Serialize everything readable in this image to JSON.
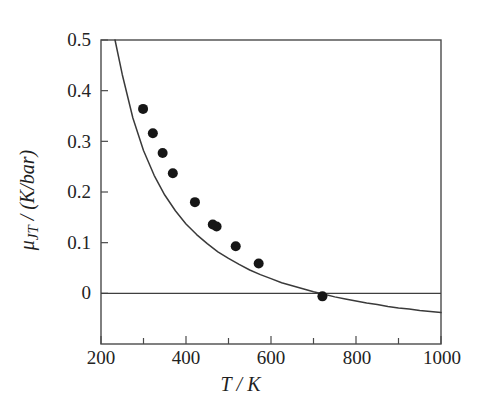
{
  "figure": {
    "background": "#ffffff",
    "frame_color": "#4a4a4a",
    "curve_color": "#3a3a3a",
    "marker_color": "#161616",
    "zero_line_color": "#3f3f3f"
  },
  "axes": {
    "x_title_prefix": "T",
    "x_title_suffix": "/ K",
    "y_title_mu": "μ",
    "y_title_sub": "JT",
    "y_title_rest": " / (K/bar)"
  },
  "chart_data": {
    "type": "scatter",
    "title": "",
    "xlabel": "T / K",
    "ylabel": "μ_JT / (K/bar)",
    "xlim": [
      200,
      1000
    ],
    "ylim": [
      -0.1,
      0.5
    ],
    "x_ticks_major": [
      200,
      400,
      600,
      800,
      1000
    ],
    "x_ticks_minor": [
      300,
      500,
      700,
      900
    ],
    "x_tick_labels": [
      "200",
      "400",
      "600",
      "800",
      "1000"
    ],
    "y_ticks_major": [
      0,
      0.1,
      0.2,
      0.3,
      0.4,
      0.5
    ],
    "y_tick_labels": [
      "0",
      "0.1",
      "0.2",
      "0.3",
      "0.4",
      "0.5"
    ],
    "grid": false,
    "legend": null,
    "zero_line": 0,
    "series": [
      {
        "name": "experimental points",
        "type": "scatter",
        "marker": "filled-circle",
        "x": [
          299,
          322,
          345,
          369,
          421,
          463,
          472,
          517,
          571,
          721
        ],
        "y": [
          0.364,
          0.316,
          0.277,
          0.237,
          0.18,
          0.136,
          0.132,
          0.093,
          0.059,
          -0.006
        ]
      },
      {
        "name": "fitted curve",
        "type": "line",
        "x": [
          233,
          250,
          275,
          300,
          325,
          350,
          375,
          400,
          425,
          450,
          475,
          500,
          525,
          550,
          575,
          600,
          625,
          650,
          675,
          700,
          725,
          750,
          775,
          800,
          825,
          850,
          875,
          900,
          925,
          950,
          975,
          1000
        ],
        "y": [
          0.5,
          0.432,
          0.346,
          0.282,
          0.233,
          0.194,
          0.163,
          0.137,
          0.116,
          0.098,
          0.082,
          0.069,
          0.057,
          0.046,
          0.037,
          0.029,
          0.021,
          0.015,
          0.009,
          0.003,
          -0.002,
          -0.007,
          -0.011,
          -0.015,
          -0.019,
          -0.022,
          -0.026,
          -0.029,
          -0.031,
          -0.034,
          -0.036,
          -0.038
        ]
      }
    ],
    "annotations": [
      {
        "text": "inversion temperature",
        "x": 801,
        "y": 0
      }
    ]
  },
  "ticks": {
    "y": [
      {
        "label": "0.5",
        "value": 0.5
      },
      {
        "label": "0.4",
        "value": 0.4
      },
      {
        "label": "0.3",
        "value": 0.3
      },
      {
        "label": "0.2",
        "value": 0.2
      },
      {
        "label": "0.1",
        "value": 0.1
      },
      {
        "label": "0",
        "value": 0
      }
    ],
    "x": [
      {
        "label": "200",
        "value": 200
      },
      {
        "label": "400",
        "value": 400
      },
      {
        "label": "600",
        "value": 600
      },
      {
        "label": "800",
        "value": 800
      },
      {
        "label": "1000",
        "value": 1000
      }
    ]
  }
}
